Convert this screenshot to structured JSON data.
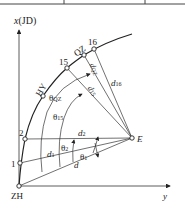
{
  "diagram": {
    "axes": {
      "x_label": "x(JD)",
      "y_label": "y",
      "origin_label": "ZH"
    },
    "points": {
      "p1": "1",
      "p2": "2",
      "hy": "HY",
      "p15": "15",
      "qz": "QZ",
      "p16": "16",
      "station": "E"
    },
    "distances": {
      "d": "d",
      "d1": "d",
      "d1_sub": "1",
      "d2": "d",
      "d2_sub": "2",
      "d15": "d",
      "d15_sub": "15",
      "dqz": "d",
      "dqz_sub": "QZ",
      "d16": "d",
      "d16_sub": "16"
    },
    "angles": {
      "t1": "θ",
      "t1_sub": "1",
      "t2": "θ",
      "t2_sub": "2",
      "t15": "θ",
      "t15_sub": "15",
      "tqz": "θ",
      "tqz_sub": "QZ"
    },
    "colors": {
      "line": "#333333",
      "background": "#ffffff"
    }
  }
}
